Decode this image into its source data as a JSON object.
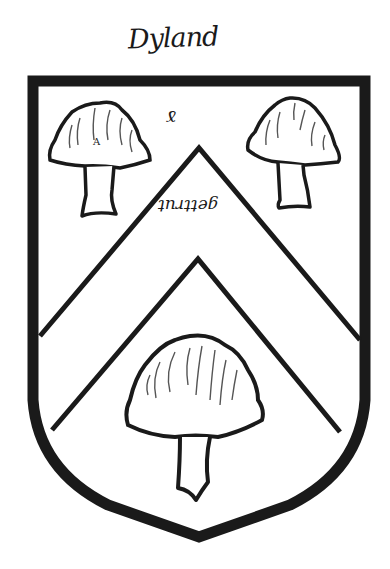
{
  "title": "Dyland",
  "annotations": {
    "cross_mark": "ɤ",
    "tincture_note": "gettrut",
    "cap_letter": "A"
  },
  "blazon": {
    "field": "argent",
    "ordinary": "chevron",
    "charges": [
      "mushroom",
      "mushroom",
      "mushroom"
    ],
    "arrangement": "two in chief, one in base"
  },
  "colors": {
    "ink": "#1a1a1a",
    "field": "#ffffff"
  },
  "icons": {
    "shield": "shield-icon",
    "mushroom": "mushroom-icon"
  }
}
